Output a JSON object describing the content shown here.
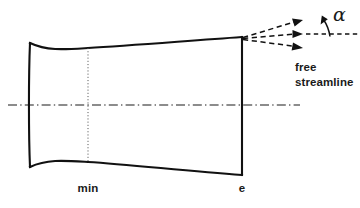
{
  "figure": {
    "type": "technical-diagram",
    "background_color": "#ffffff",
    "line_color": "#111111",
    "width": 360,
    "height": 208
  },
  "labels": {
    "station_min": "min",
    "station_exit": "e",
    "free_streamline_line1": "free",
    "free_streamline_line2": "streamline",
    "angle_symbol": "α"
  },
  "geometry": {
    "nozzle": {
      "inlet_x": 30,
      "throat_x": 88,
      "exit_x": 242,
      "centerline_y": 105,
      "inlet_top_y": 43,
      "inlet_bottom_y": 167,
      "throat_top_y": 48,
      "throat_bottom_y": 162,
      "exit_top_y": 37,
      "exit_bottom_y": 175
    },
    "centerline": {
      "x_start": 8,
      "x_end": 300,
      "y": 105
    },
    "station_line_min": {
      "x": 88,
      "y_top": 48,
      "y_bottom": 162
    },
    "streamlines": [
      {
        "name": "upper",
        "from": [
          242,
          37
        ],
        "to": [
          300,
          21
        ]
      },
      {
        "name": "middle",
        "from": [
          242,
          38
        ],
        "to": [
          300,
          34
        ]
      },
      {
        "name": "lower",
        "from": [
          242,
          39
        ],
        "to": [
          300,
          47
        ]
      }
    ],
    "reference_axis": {
      "x_start": 305,
      "x_end": 358,
      "y": 34
    },
    "angle_arc": {
      "vertex": [
        327,
        34
      ],
      "tip": [
        322,
        17
      ]
    }
  }
}
